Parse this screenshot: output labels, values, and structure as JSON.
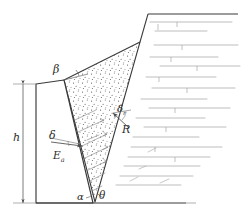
{
  "figure": {
    "background": "#ffffff",
    "line_color": "#3a3a3a",
    "hatch_color": "#9a9a9a",
    "stipple_color": "#555555",
    "label_color": "#2b2b2b"
  },
  "labels": {
    "beta": "β",
    "delta": "δ",
    "Ea_base": "E",
    "Ea_sub": "a",
    "delta_r_base": "δ",
    "delta_r_sub": "r",
    "R": "R",
    "alpha": "α",
    "theta": "θ",
    "h": "h"
  },
  "geometry": {
    "ground_line": {
      "x1": 36,
      "y1": 203,
      "x2": 186,
      "y2": 203
    },
    "wall": {
      "front_top": {
        "x": 36,
        "y": 84
      },
      "front_bottom": {
        "x": 36,
        "y": 203
      },
      "back_top": {
        "x": 64,
        "y": 80
      },
      "back_bottom": {
        "x": 93,
        "y": 203
      }
    },
    "wedge": {
      "apex_bottom": {
        "x": 95,
        "y": 202
      },
      "top_left": {
        "x": 64,
        "y": 80
      },
      "top_right": {
        "x": 140,
        "y": 42
      }
    },
    "slope_crest": {
      "x": 148,
      "y": 14
    },
    "slope_top_line": {
      "x1": 148,
      "y1": 14,
      "x2": 238,
      "y2": 14
    },
    "dimension_h": {
      "x": 23,
      "y_top": 84,
      "y_bottom": 203
    }
  },
  "annotations": {
    "Ea_force_arrow": "active earth pressure resultant pointing into wall back face",
    "R_force_arrow": "reaction on slip surface",
    "beta_arc": "angle between wall top and backfill surface",
    "delta_arc": "wall friction angle at back face",
    "delta_r_arc": "friction angle on slip plane",
    "alpha_arc": "angle at wedge apex left side",
    "theta_arc": "angle at wedge apex right side"
  }
}
